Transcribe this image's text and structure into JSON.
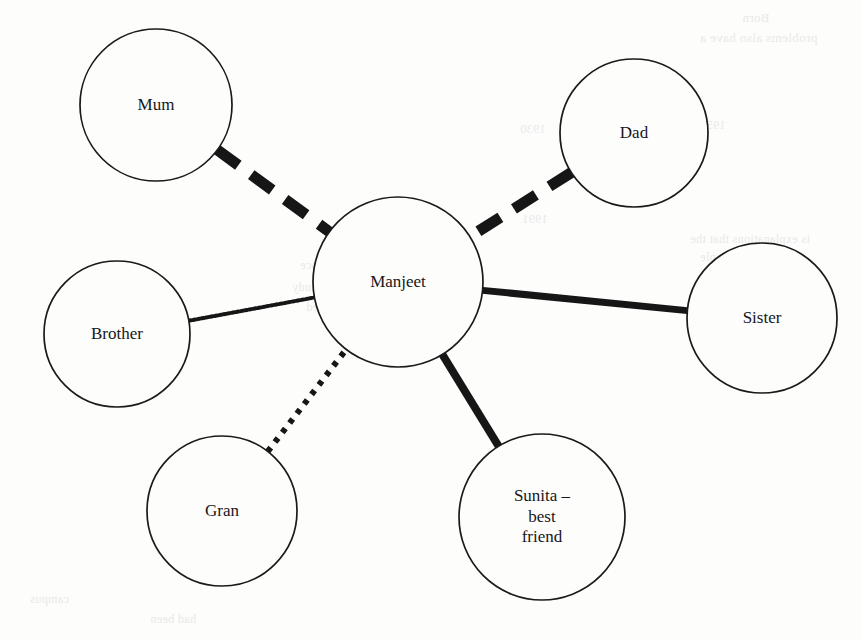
{
  "diagram": {
    "type": "relationship-circle",
    "center_node": {
      "id": "manjeet",
      "label": "Manjeet",
      "cx": 398,
      "cy": 282,
      "r": 85,
      "font_size": 17
    },
    "nodes": [
      {
        "id": "mum",
        "label": "Mum",
        "cx": 156,
        "cy": 105,
        "r": 76,
        "font_size": 17
      },
      {
        "id": "dad",
        "label": "Dad",
        "cx": 634,
        "cy": 133,
        "r": 74,
        "font_size": 17
      },
      {
        "id": "brother",
        "label": "Brother",
        "cx": 117,
        "cy": 334,
        "r": 73,
        "font_size": 17
      },
      {
        "id": "sister",
        "label": "Sister",
        "cx": 762,
        "cy": 318,
        "r": 75,
        "font_size": 17
      },
      {
        "id": "gran",
        "label": "Gran",
        "cx": 222,
        "cy": 511,
        "r": 75,
        "font_size": 17
      },
      {
        "id": "sunita",
        "label": "Sunita –\nbest\nfriend",
        "cx": 542,
        "cy": 517,
        "r": 83,
        "font_size": 17
      }
    ],
    "edges": [
      {
        "id": "edge-mum",
        "from": "mum",
        "to": "manjeet",
        "style": "thick-dashed",
        "stroke_width": 11,
        "dash": "26 16",
        "closeness": "dashed"
      },
      {
        "id": "edge-dad",
        "from": "dad",
        "to": "manjeet",
        "style": "thick-dashed",
        "stroke_width": 11,
        "dash": "26 16",
        "closeness": "dashed"
      },
      {
        "id": "edge-sister",
        "from": "sister",
        "to": "manjeet",
        "style": "thick-solid",
        "stroke_width": 7,
        "dash": "none",
        "closeness": "solid"
      },
      {
        "id": "edge-sunita",
        "from": "sunita",
        "to": "manjeet",
        "style": "thick-solid",
        "stroke_width": 8,
        "dash": "none",
        "closeness": "solid"
      },
      {
        "id": "edge-brother",
        "from": "brother",
        "to": "manjeet",
        "style": "fine-dotted",
        "stroke_width": 4,
        "dash": "2.2 2.2",
        "closeness": "fine-dotted"
      },
      {
        "id": "edge-gran",
        "from": "gran",
        "to": "manjeet",
        "style": "square-dotted",
        "stroke_width": 6,
        "dash": "5 7",
        "closeness": "square-dotted"
      }
    ],
    "colors": {
      "ink": "#161616",
      "node_stroke": "#1a1a1a",
      "paper": "#fdfdfc",
      "showthrough": "#e9e9e6"
    },
    "node_stroke_width": 1.7
  },
  "showthrough_text": [
    {
      "text": "Born",
      "x": 742,
      "y": 10,
      "size": 13
    },
    {
      "text": "problems also have a",
      "x": 700,
      "y": 30,
      "size": 13
    },
    {
      "text": "1930",
      "x": 520,
      "y": 122,
      "size": 12
    },
    {
      "text": "1950",
      "x": 700,
      "y": 118,
      "size": 12
    },
    {
      "text": "is explanations that the",
      "x": 690,
      "y": 232,
      "size": 12
    },
    {
      "text": "number of people",
      "x": 700,
      "y": 250,
      "size": 12
    },
    {
      "text": "1991",
      "x": 522,
      "y": 212,
      "size": 12
    },
    {
      "text": "the thing",
      "x": 706,
      "y": 268,
      "size": 12
    },
    {
      "text": "included, and hence",
      "x": 300,
      "y": 258,
      "size": 12
    },
    {
      "text": "of the available study",
      "x": 292,
      "y": 280,
      "size": 12
    },
    {
      "text": "they expected",
      "x": 306,
      "y": 300,
      "size": 12
    },
    {
      "text": "campus",
      "x": 30,
      "y": 592,
      "size": 12
    },
    {
      "text": "had been",
      "x": 150,
      "y": 612,
      "size": 12
    }
  ]
}
